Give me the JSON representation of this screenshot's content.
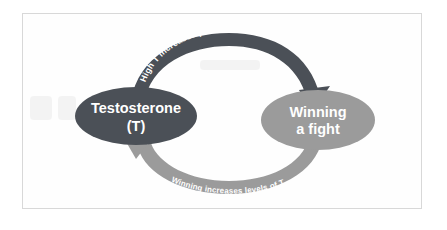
{
  "figure": {
    "kind": "cycle-diagram",
    "background_color": "#ffffff",
    "frame_color": "#d8d8d8"
  },
  "nodes": [
    {
      "id": "testosterone",
      "line1": "Testosterone",
      "line2": "(T)",
      "fill": "#4b5057",
      "text_color": "#ffffff"
    },
    {
      "id": "winning",
      "line1": "Winning",
      "line2": "a fight",
      "fill": "#9b9b9b",
      "text_color": "#ffffff"
    }
  ],
  "arrows": [
    {
      "id": "top-arrow",
      "from": "testosterone",
      "to": "winning",
      "label_part1": "High T",
      "label_part2": "increases probability of",
      "fill": "#4b5057",
      "text_color": "#ffffff"
    },
    {
      "id": "bottom-arrow",
      "from": "winning",
      "to": "testosterone",
      "label": "Winning increases levels of T",
      "fill": "#9b9b9b",
      "text_color": "#ffffff"
    }
  ]
}
